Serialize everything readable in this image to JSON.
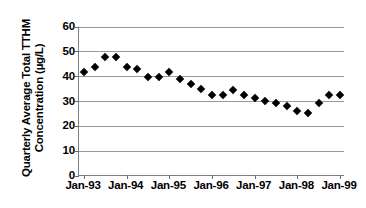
{
  "chart_data": {
    "type": "scatter",
    "title": "",
    "xlabel": "",
    "ylabel": "Quarterly Average Total TTHM Concentration (µg/L)",
    "ylabel_line1": "Quarterly Average Total TTHM",
    "ylabel_line2": "Concentration (µg/L)",
    "ylim": [
      0,
      60
    ],
    "ytick_values": [
      0,
      10,
      20,
      30,
      40,
      50,
      60
    ],
    "ytick_labels": [
      "0",
      "10",
      "20",
      "30",
      "40",
      "50",
      "60"
    ],
    "xtick_labels": [
      "Jan-93",
      "Jan-94",
      "Jan-95",
      "Jan-96",
      "Jan-97",
      "Jan-98",
      "Jan-99"
    ],
    "xlim_labels": [
      "Jan-93",
      "Jan-99"
    ],
    "grid": true,
    "legend": "none",
    "marker": "diamond",
    "marker_color": "#000000",
    "gridline_color": "#9a9a9a",
    "axis_color": "#808080",
    "x": [
      "Jan-93",
      "Apr-93",
      "Jul-93",
      "Oct-93",
      "Jan-94",
      "Apr-94",
      "Jul-94",
      "Oct-94",
      "Jan-95",
      "Apr-95",
      "Jul-95",
      "Oct-95",
      "Jan-96",
      "Apr-96",
      "Jul-96",
      "Oct-96",
      "Jan-97",
      "Apr-97",
      "Jul-97",
      "Oct-97",
      "Jan-98",
      "Apr-98",
      "Jul-98",
      "Oct-98",
      "Jan-99"
    ],
    "values": [
      42.0,
      44.0,
      48.0,
      48.0,
      44.0,
      43.0,
      40.0,
      40.0,
      42.0,
      39.0,
      37.0,
      35.0,
      32.5,
      32.5,
      34.5,
      32.5,
      31.5,
      30.2,
      29.5,
      28.2,
      26.2,
      25.3,
      29.5,
      32.5,
      32.5
    ],
    "points": [
      {
        "x": 0.0,
        "y": 42.0
      },
      {
        "x": 1.0,
        "y": 44.0
      },
      {
        "x": 2.0,
        "y": 48.0
      },
      {
        "x": 3.0,
        "y": 48.0
      },
      {
        "x": 4.0,
        "y": 44.0
      },
      {
        "x": 5.0,
        "y": 43.0
      },
      {
        "x": 6.0,
        "y": 40.0
      },
      {
        "x": 7.0,
        "y": 40.0
      },
      {
        "x": 8.0,
        "y": 42.0
      },
      {
        "x": 9.0,
        "y": 39.0
      },
      {
        "x": 10.0,
        "y": 37.0
      },
      {
        "x": 11.0,
        "y": 35.0
      },
      {
        "x": 12.0,
        "y": 32.5
      },
      {
        "x": 13.0,
        "y": 32.5
      },
      {
        "x": 14.0,
        "y": 34.5
      },
      {
        "x": 15.0,
        "y": 32.5
      },
      {
        "x": 16.0,
        "y": 31.5
      },
      {
        "x": 17.0,
        "y": 30.2
      },
      {
        "x": 18.0,
        "y": 29.5
      },
      {
        "x": 19.0,
        "y": 28.2
      },
      {
        "x": 20.0,
        "y": 26.2
      },
      {
        "x": 21.0,
        "y": 25.3
      },
      {
        "x": 22.0,
        "y": 29.5
      },
      {
        "x": 23.0,
        "y": 32.5
      },
      {
        "x": 24.0,
        "y": 32.5
      }
    ]
  }
}
